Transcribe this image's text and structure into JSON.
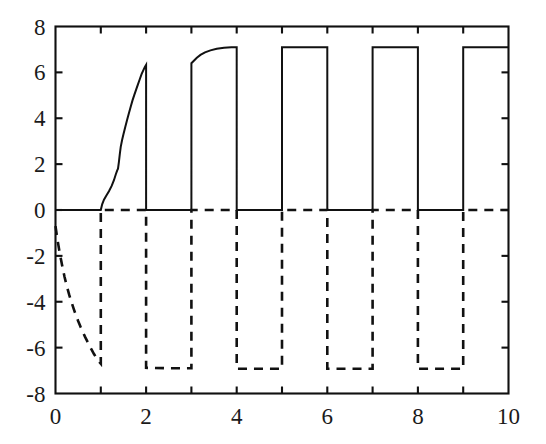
{
  "chart_data": {
    "type": "line",
    "title": "",
    "xlabel": "",
    "ylabel": "",
    "xlim": [
      0,
      10
    ],
    "ylim": [
      -8,
      8
    ],
    "grid": false,
    "legend": "none",
    "x_ticks": [
      0,
      2,
      4,
      6,
      8,
      10
    ],
    "x_tick_labels": [
      "0",
      "2",
      "4",
      "6",
      "8",
      "10"
    ],
    "x_minor_ticks": [
      1,
      3,
      5,
      7,
      9
    ],
    "y_ticks": [
      -8,
      -6,
      -4,
      -2,
      0,
      2,
      4,
      6,
      8
    ],
    "y_tick_labels": [
      "-8",
      "-6",
      "-4",
      "-2",
      "0",
      "2",
      "4",
      "6",
      "8"
    ],
    "series": [
      {
        "name": "solid-signal",
        "style": "solid",
        "color": "#111111",
        "description": "Positive square-wave control signal, zero on even intervals, pulsing high on odd intervals; first pulse rises gradually from 0 to 6.3, later pulses saturate near 7.1",
        "points": [
          [
            0.0,
            0.0
          ],
          [
            0.5,
            0.0
          ],
          [
            0.9,
            0.0
          ],
          [
            1.0,
            0.0
          ],
          [
            1.03,
            0.25
          ],
          [
            1.07,
            0.45
          ],
          [
            1.12,
            0.62
          ],
          [
            1.18,
            0.82
          ],
          [
            1.24,
            1.05
          ],
          [
            1.29,
            1.3
          ],
          [
            1.33,
            1.55
          ],
          [
            1.36,
            1.72
          ],
          [
            1.38,
            1.8
          ],
          [
            1.4,
            2.1
          ],
          [
            1.42,
            2.45
          ],
          [
            1.44,
            2.75
          ],
          [
            1.47,
            3.05
          ],
          [
            1.5,
            3.3
          ],
          [
            1.54,
            3.62
          ],
          [
            1.58,
            3.92
          ],
          [
            1.62,
            4.22
          ],
          [
            1.66,
            4.5
          ],
          [
            1.7,
            4.78
          ],
          [
            1.74,
            5.02
          ],
          [
            1.78,
            5.25
          ],
          [
            1.82,
            5.48
          ],
          [
            1.86,
            5.7
          ],
          [
            1.9,
            5.92
          ],
          [
            1.94,
            6.1
          ],
          [
            1.97,
            6.22
          ],
          [
            2.0,
            6.32
          ],
          [
            2.0,
            0.0
          ],
          [
            2.5,
            0.0
          ],
          [
            3.0,
            0.0
          ],
          [
            3.0,
            6.4
          ],
          [
            3.06,
            6.52
          ],
          [
            3.12,
            6.64
          ],
          [
            3.2,
            6.76
          ],
          [
            3.3,
            6.87
          ],
          [
            3.42,
            6.96
          ],
          [
            3.56,
            7.03
          ],
          [
            3.72,
            7.07
          ],
          [
            3.88,
            7.1
          ],
          [
            4.0,
            7.1
          ],
          [
            4.0,
            0.0
          ],
          [
            4.5,
            0.0
          ],
          [
            5.0,
            0.0
          ],
          [
            5.0,
            7.1
          ],
          [
            5.5,
            7.1
          ],
          [
            6.0,
            7.1
          ],
          [
            6.0,
            0.0
          ],
          [
            6.5,
            0.0
          ],
          [
            7.0,
            0.0
          ],
          [
            7.0,
            7.1
          ],
          [
            7.5,
            7.1
          ],
          [
            8.0,
            7.1
          ],
          [
            8.0,
            0.0
          ],
          [
            8.5,
            0.0
          ],
          [
            9.0,
            0.0
          ],
          [
            9.0,
            7.1
          ],
          [
            9.5,
            7.1
          ],
          [
            10.0,
            7.1
          ]
        ]
      },
      {
        "name": "dashed-signal",
        "style": "dashed",
        "color": "#111111",
        "description": "Negative square-wave control signal, complementary to the solid one; initial exponential decay from -0.7 to -6.7 over the first second, then flat-bottom pulses at about -6.9",
        "points": [
          [
            0.0,
            -0.7
          ],
          [
            0.04,
            -1.25
          ],
          [
            0.08,
            -1.72
          ],
          [
            0.12,
            -2.15
          ],
          [
            0.16,
            -2.55
          ],
          [
            0.2,
            -2.92
          ],
          [
            0.25,
            -3.32
          ],
          [
            0.3,
            -3.68
          ],
          [
            0.35,
            -4.0
          ],
          [
            0.4,
            -4.3
          ],
          [
            0.45,
            -4.58
          ],
          [
            0.5,
            -4.84
          ],
          [
            0.55,
            -5.08
          ],
          [
            0.6,
            -5.3
          ],
          [
            0.65,
            -5.52
          ],
          [
            0.7,
            -5.72
          ],
          [
            0.75,
            -5.92
          ],
          [
            0.8,
            -6.1
          ],
          [
            0.85,
            -6.28
          ],
          [
            0.9,
            -6.44
          ],
          [
            0.95,
            -6.58
          ],
          [
            1.0,
            -6.7
          ],
          [
            1.0,
            0.0
          ],
          [
            1.5,
            0.0
          ],
          [
            2.0,
            0.0
          ],
          [
            2.0,
            -6.88
          ],
          [
            2.5,
            -6.9
          ],
          [
            3.0,
            -6.9
          ],
          [
            3.0,
            0.0
          ],
          [
            3.5,
            0.0
          ],
          [
            4.0,
            0.0
          ],
          [
            4.0,
            -6.92
          ],
          [
            4.5,
            -6.92
          ],
          [
            5.0,
            -6.92
          ],
          [
            5.0,
            0.0
          ],
          [
            5.5,
            0.0
          ],
          [
            6.0,
            0.0
          ],
          [
            6.0,
            -6.92
          ],
          [
            6.5,
            -6.92
          ],
          [
            7.0,
            -6.92
          ],
          [
            7.0,
            0.0
          ],
          [
            7.5,
            0.0
          ],
          [
            8.0,
            0.0
          ],
          [
            8.0,
            -6.92
          ],
          [
            8.5,
            -6.92
          ],
          [
            9.0,
            -6.92
          ],
          [
            9.0,
            0.0
          ],
          [
            9.5,
            0.0
          ],
          [
            10.0,
            0.0
          ]
        ]
      }
    ]
  }
}
